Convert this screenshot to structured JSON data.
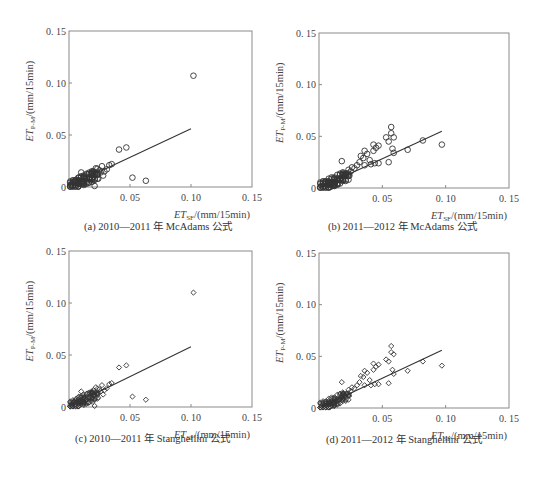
{
  "chart_data": [
    {
      "id": "a",
      "type": "scatter",
      "caption": "(a) 2010—2011 年 McAdams 公式",
      "marker": "circle",
      "xlabel": "ET_SF/(mm/15min)",
      "ylabel": "ET_P-M/(mm/15min)",
      "xlim": [
        0,
        0.15
      ],
      "ylim": [
        0,
        0.15
      ],
      "xticks": [
        "0.05",
        "0.10",
        "0.15"
      ],
      "yticks": [
        "0",
        "0.05",
        "0.10",
        "0.15"
      ],
      "grid": false,
      "fit_line": {
        "x0": 0.02,
        "y0": 0.012,
        "x1": 0.1,
        "y1": 0.056
      },
      "points": [
        [
          0.102,
          0.107
        ],
        [
          0.047,
          0.038
        ],
        [
          0.041,
          0.036
        ],
        [
          0.052,
          0.009
        ],
        [
          0.063,
          0.006
        ],
        [
          0.035,
          0.022
        ],
        [
          0.033,
          0.021
        ],
        [
          0.027,
          0.02
        ],
        [
          0.022,
          0.018
        ],
        [
          0.025,
          0.016
        ],
        [
          0.02,
          0.015
        ],
        [
          0.018,
          0.013
        ],
        [
          0.01,
          0.014
        ],
        [
          0.015,
          0.012
        ],
        [
          0.012,
          0.011
        ],
        [
          0.008,
          0.009
        ],
        [
          0.006,
          0.007
        ],
        [
          0.004,
          0.005
        ],
        [
          0.003,
          0.003
        ],
        [
          0.002,
          0.002
        ],
        [
          0.005,
          0.002
        ],
        [
          0.008,
          0.003
        ],
        [
          0.011,
          0.005
        ],
        [
          0.014,
          0.006
        ],
        [
          0.017,
          0.008
        ],
        [
          0.02,
          0.01
        ],
        [
          0.023,
          0.012
        ],
        [
          0.026,
          0.014
        ],
        [
          0.029,
          0.015
        ],
        [
          0.031,
          0.017
        ],
        [
          0.021,
          0.001
        ],
        [
          0.016,
          0.004
        ],
        [
          0.013,
          0.008
        ],
        [
          0.009,
          0.006
        ],
        [
          0.007,
          0.004
        ],
        [
          0.024,
          0.008
        ],
        [
          0.019,
          0.005
        ],
        [
          0.028,
          0.011
        ],
        [
          0.003,
          0.001
        ],
        [
          0.001,
          0.002
        ]
      ]
    },
    {
      "id": "b",
      "type": "scatter",
      "caption": "(b) 2011—2012 年 McAdams 公式",
      "marker": "circle",
      "xlabel": "ET_SF/(mm/15min)",
      "ylabel": "ET_P-M/(mm/15min)",
      "xlim": [
        0,
        0.15
      ],
      "ylim": [
        0,
        0.15
      ],
      "xticks": [
        "0.05",
        "0.10",
        "0.15"
      ],
      "yticks": [
        "0",
        "0.05",
        "0.10",
        "0.15"
      ],
      "grid": false,
      "fit_line": {
        "x0": 0.0,
        "y0": 0.0,
        "x1": 0.097,
        "y1": 0.055
      },
      "points": [
        [
          0.097,
          0.042
        ],
        [
          0.082,
          0.046
        ],
        [
          0.07,
          0.037
        ],
        [
          0.057,
          0.059
        ],
        [
          0.057,
          0.053
        ],
        [
          0.059,
          0.049
        ],
        [
          0.053,
          0.049
        ],
        [
          0.055,
          0.045
        ],
        [
          0.058,
          0.038
        ],
        [
          0.059,
          0.034
        ],
        [
          0.055,
          0.025
        ],
        [
          0.047,
          0.041
        ],
        [
          0.043,
          0.042
        ],
        [
          0.045,
          0.039
        ],
        [
          0.043,
          0.036
        ],
        [
          0.038,
          0.033
        ],
        [
          0.036,
          0.036
        ],
        [
          0.033,
          0.031
        ],
        [
          0.035,
          0.029
        ],
        [
          0.04,
          0.027
        ],
        [
          0.047,
          0.024
        ],
        [
          0.044,
          0.024
        ],
        [
          0.041,
          0.023
        ],
        [
          0.018,
          0.026
        ],
        [
          0.03,
          0.022
        ],
        [
          0.028,
          0.019
        ],
        [
          0.025,
          0.016
        ],
        [
          0.022,
          0.014
        ],
        [
          0.02,
          0.012
        ],
        [
          0.018,
          0.01
        ],
        [
          0.016,
          0.008
        ],
        [
          0.014,
          0.007
        ],
        [
          0.012,
          0.006
        ],
        [
          0.01,
          0.005
        ],
        [
          0.008,
          0.004
        ],
        [
          0.006,
          0.003
        ],
        [
          0.004,
          0.002
        ],
        [
          0.002,
          0.002
        ],
        [
          0.005,
          0.006
        ],
        [
          0.026,
          0.02
        ],
        [
          0.032,
          0.025
        ],
        [
          0.036,
          0.022
        ],
        [
          0.024,
          0.012
        ],
        [
          0.015,
          0.004
        ],
        [
          0.011,
          0.002
        ],
        [
          0.009,
          0.001
        ]
      ]
    },
    {
      "id": "c",
      "type": "scatter",
      "caption": "(c) 2010—2011 年 Stanghellini 公式",
      "marker": "diamond",
      "xlabel": "ET_SF/(mm/15min)",
      "ylabel": "ET_P-M/(mm/15min)",
      "xlim": [
        0,
        0.15
      ],
      "ylim": [
        0,
        0.15
      ],
      "xticks": [
        "0.05",
        "0.10",
        "0.15"
      ],
      "yticks": [
        "0",
        "0.05",
        "0.10",
        "0.15"
      ],
      "grid": false,
      "fit_line": {
        "x0": 0.02,
        "y0": 0.012,
        "x1": 0.1,
        "y1": 0.058
      },
      "points": [
        [
          0.102,
          0.11
        ],
        [
          0.047,
          0.04
        ],
        [
          0.041,
          0.038
        ],
        [
          0.052,
          0.01
        ],
        [
          0.063,
          0.007
        ],
        [
          0.035,
          0.023
        ],
        [
          0.033,
          0.022
        ],
        [
          0.027,
          0.021
        ],
        [
          0.022,
          0.019
        ],
        [
          0.025,
          0.017
        ],
        [
          0.02,
          0.016
        ],
        [
          0.018,
          0.014
        ],
        [
          0.01,
          0.015
        ],
        [
          0.015,
          0.013
        ],
        [
          0.012,
          0.012
        ],
        [
          0.008,
          0.01
        ],
        [
          0.006,
          0.008
        ],
        [
          0.004,
          0.005
        ],
        [
          0.003,
          0.003
        ],
        [
          0.002,
          0.002
        ],
        [
          0.005,
          0.002
        ],
        [
          0.008,
          0.003
        ],
        [
          0.011,
          0.005
        ],
        [
          0.014,
          0.007
        ],
        [
          0.017,
          0.009
        ],
        [
          0.02,
          0.011
        ],
        [
          0.023,
          0.013
        ],
        [
          0.026,
          0.015
        ],
        [
          0.029,
          0.016
        ],
        [
          0.031,
          0.018
        ],
        [
          0.021,
          0.001
        ],
        [
          0.016,
          0.004
        ],
        [
          0.013,
          0.008
        ],
        [
          0.009,
          0.006
        ],
        [
          0.007,
          0.004
        ],
        [
          0.024,
          0.009
        ],
        [
          0.019,
          0.005
        ],
        [
          0.028,
          0.012
        ],
        [
          0.003,
          0.001
        ],
        [
          0.001,
          0.002
        ]
      ]
    },
    {
      "id": "d",
      "type": "scatter",
      "caption": "(d) 2011—2012 年 Stanghellini 公式",
      "marker": "diamond",
      "xlabel": "ET_SF/(mm/15min)",
      "ylabel": "ET_P-M/(mm/15min)",
      "xlim": [
        0,
        0.15
      ],
      "ylim": [
        0,
        0.15
      ],
      "xticks": [
        "0.05",
        "0.10",
        "0.15"
      ],
      "yticks": [
        "0",
        "0.05",
        "0.10",
        "0.15"
      ],
      "grid": false,
      "fit_line": {
        "x0": 0.0,
        "y0": 0.0,
        "x1": 0.097,
        "y1": 0.056
      },
      "points": [
        [
          0.097,
          0.041
        ],
        [
          0.082,
          0.045
        ],
        [
          0.07,
          0.036
        ],
        [
          0.057,
          0.06
        ],
        [
          0.057,
          0.054
        ],
        [
          0.059,
          0.052
        ],
        [
          0.053,
          0.047
        ],
        [
          0.055,
          0.045
        ],
        [
          0.058,
          0.037
        ],
        [
          0.059,
          0.033
        ],
        [
          0.055,
          0.024
        ],
        [
          0.047,
          0.042
        ],
        [
          0.043,
          0.043
        ],
        [
          0.045,
          0.04
        ],
        [
          0.043,
          0.037
        ],
        [
          0.038,
          0.034
        ],
        [
          0.036,
          0.036
        ],
        [
          0.033,
          0.031
        ],
        [
          0.035,
          0.03
        ],
        [
          0.04,
          0.027
        ],
        [
          0.047,
          0.023
        ],
        [
          0.044,
          0.023
        ],
        [
          0.041,
          0.022
        ],
        [
          0.018,
          0.025
        ],
        [
          0.03,
          0.022
        ],
        [
          0.028,
          0.019
        ],
        [
          0.025,
          0.016
        ],
        [
          0.022,
          0.014
        ],
        [
          0.02,
          0.012
        ],
        [
          0.018,
          0.01
        ],
        [
          0.016,
          0.008
        ],
        [
          0.014,
          0.007
        ],
        [
          0.012,
          0.006
        ],
        [
          0.01,
          0.005
        ],
        [
          0.008,
          0.004
        ],
        [
          0.006,
          0.003
        ],
        [
          0.004,
          0.002
        ],
        [
          0.002,
          0.002
        ],
        [
          0.005,
          0.006
        ],
        [
          0.026,
          0.02
        ],
        [
          0.032,
          0.025
        ],
        [
          0.036,
          0.022
        ],
        [
          0.024,
          0.012
        ],
        [
          0.015,
          0.004
        ],
        [
          0.011,
          0.002
        ],
        [
          0.009,
          0.001
        ]
      ]
    }
  ],
  "labels": {
    "et": "ET",
    "y_sub": "P-M",
    "x_sub": "SF",
    "unit": "/(mm/15min)"
  }
}
